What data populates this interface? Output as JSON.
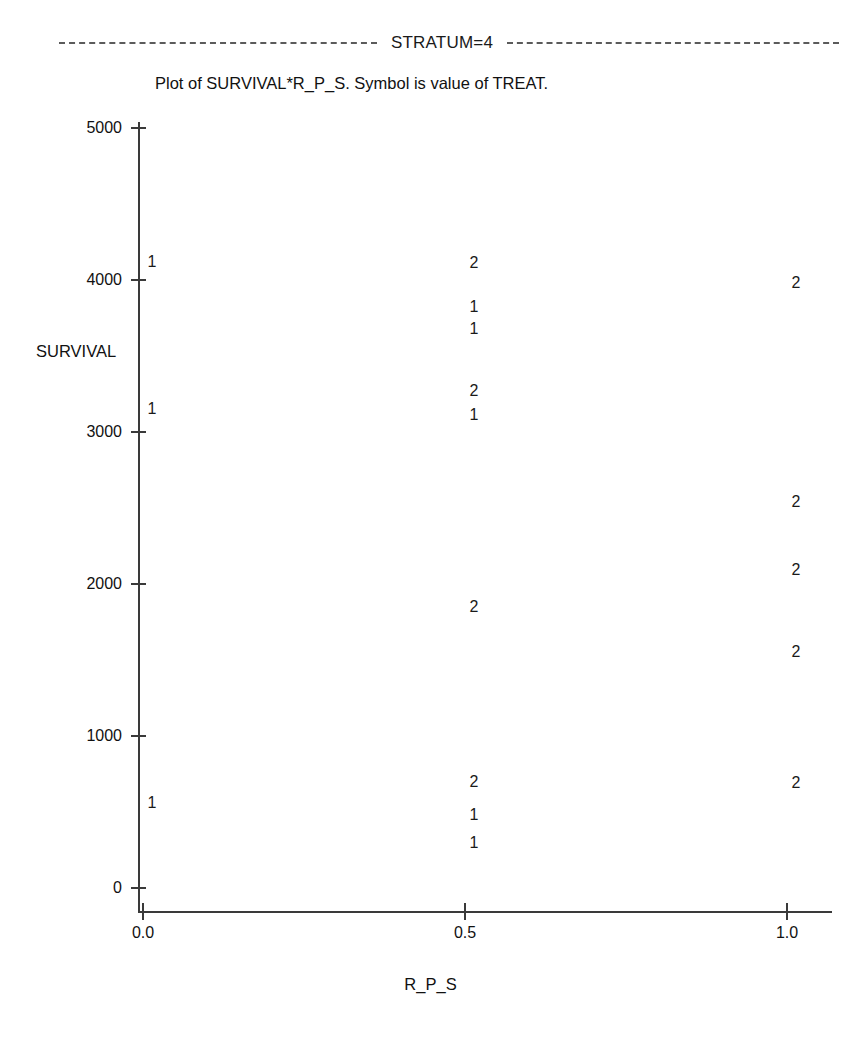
{
  "header": {
    "stratum_label": "STRATUM=4",
    "rule_style": "dashed"
  },
  "subtitle": "Plot of SURVIVAL*R_P_S.  Symbol is value of TREAT.",
  "axes": {
    "y_title": "SURVIVAL",
    "x_title": "R_P_S",
    "y_ticks": [
      "0",
      "1000",
      "2000",
      "3000",
      "4000",
      "5000"
    ],
    "x_ticks": [
      "0.0",
      "0.5",
      "1.0"
    ]
  },
  "chart_data": {
    "type": "scatter",
    "title": "Plot of SURVIVAL*R_P_S.  Symbol is value of TREAT.",
    "subtitle": "STRATUM=4",
    "xlabel": "R_P_S",
    "ylabel": "SURVIVAL",
    "xlim": [
      0.0,
      1.0
    ],
    "ylim": [
      0,
      5000
    ],
    "xticks": [
      0.0,
      0.5,
      1.0
    ],
    "yticks": [
      0,
      1000,
      2000,
      3000,
      4000,
      5000
    ],
    "grid": false,
    "legend": "none",
    "symbol_variable": "TREAT",
    "symbols": [
      "1",
      "2"
    ],
    "series": [
      {
        "name": "1",
        "points": [
          {
            "x": 0.0,
            "y": 4120
          },
          {
            "x": 0.0,
            "y": 3150
          },
          {
            "x": 0.0,
            "y": 560
          },
          {
            "x": 0.5,
            "y": 3820
          },
          {
            "x": 0.5,
            "y": 3675
          },
          {
            "x": 0.5,
            "y": 3110
          },
          {
            "x": 0.5,
            "y": 480
          },
          {
            "x": 0.5,
            "y": 295
          }
        ]
      },
      {
        "name": "2",
        "points": [
          {
            "x": 0.5,
            "y": 4110
          },
          {
            "x": 0.5,
            "y": 3270
          },
          {
            "x": 0.5,
            "y": 1850
          },
          {
            "x": 0.5,
            "y": 700
          },
          {
            "x": 1.0,
            "y": 3980
          },
          {
            "x": 1.0,
            "y": 2540
          },
          {
            "x": 1.0,
            "y": 2090
          },
          {
            "x": 1.0,
            "y": 1550
          },
          {
            "x": 1.0,
            "y": 690
          }
        ]
      }
    ]
  },
  "render": {
    "plot_left_px": 143,
    "plot_right_px": 787,
    "plot_zero_y_px": 888,
    "plot_top_y_px": 128,
    "y_value_top": 5000,
    "y_value_bottom": 0,
    "symbol_x_offset_px": 9,
    "axis_color": "#3a3a3a",
    "text_color": "#1a1a1a"
  }
}
